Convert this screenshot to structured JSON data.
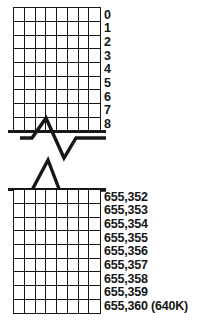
{
  "diagram": {
    "ink_color": "#171717",
    "background_color": "#ffffff",
    "break_symbol_name": "zigzag-break",
    "top_block": {
      "columns": 8,
      "rows": 9,
      "row_labels": [
        "0",
        "1",
        "2",
        "3",
        "4",
        "5",
        "6",
        "7",
        "8"
      ]
    },
    "bottom_block": {
      "columns": 8,
      "rows": 9,
      "row_labels": [
        "655,352",
        "655,353",
        "655,354",
        "655,355",
        "655,356",
        "655,357",
        "655,358",
        "655,359",
        "655,360 (640K)"
      ]
    }
  }
}
